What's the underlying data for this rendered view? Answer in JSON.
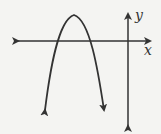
{
  "diagram": {
    "type": "function-graph",
    "axes": {
      "x_label": "x",
      "y_label": "y"
    },
    "curve": {
      "shape": "parabola",
      "opens": "down",
      "vertex_quadrant": "II",
      "x_intercepts": "two, both negative",
      "color": "#333333"
    }
  }
}
